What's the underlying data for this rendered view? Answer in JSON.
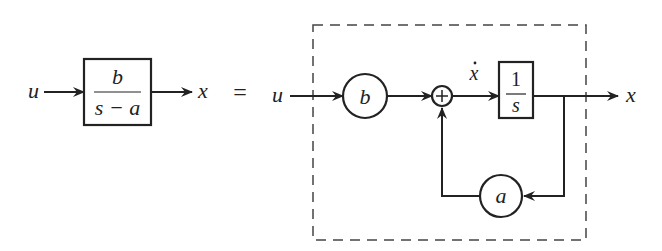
{
  "diagram": {
    "type": "block-diagram",
    "left": {
      "input_label": "u",
      "output_label": "x",
      "block": {
        "numerator": "b",
        "denominator": "s − a"
      }
    },
    "equals": "=",
    "right": {
      "input_label": "u",
      "output_label": "x",
      "gain_b": "b",
      "summing_junction": "+",
      "integrator_input_label": "x",
      "integrator_input_dot": "·",
      "integrator": {
        "numerator": "1",
        "denominator": "s"
      },
      "feedback_gain": "a"
    },
    "colors": {
      "line": "#222222",
      "dashed": "#444444",
      "background": "#ffffff"
    }
  }
}
